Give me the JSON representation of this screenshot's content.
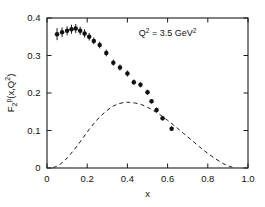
{
  "chart_data": {
    "type": "scatter",
    "title": "",
    "xlabel": "x",
    "ylabel": "F2p(x,Q2)",
    "ylabel_parts": {
      "base": "F",
      "sub": "2",
      "sup": "p",
      "args": "(x,Q",
      "args_sup": "2",
      "close": ")"
    },
    "xlim": [
      0.0,
      1.0
    ],
    "ylim": [
      0.0,
      0.4
    ],
    "xticks": [
      0.0,
      0.2,
      0.4,
      0.6,
      0.8,
      1.0
    ],
    "xticklabels": [
      "0",
      "0.2",
      "0.4",
      "0.6",
      "0.8",
      "1.0"
    ],
    "yticks": [
      0.0,
      0.1,
      0.2,
      0.3,
      0.4
    ],
    "yticklabels": [
      "0",
      "0.1",
      "0.2",
      "0.3",
      "0.4"
    ],
    "grid": false,
    "legend": "none",
    "annotations": [
      {
        "name": "q-squared-annotation",
        "text": "Q2 = 3.5 GeV2",
        "parts": {
          "sym": "Q",
          "sym_sup": "2",
          "mid": " = 3.5 GeV",
          "end_sup": "2"
        },
        "x": 0.6,
        "y": 0.352
      }
    ],
    "series": [
      {
        "name": "F2p measured data",
        "kind": "scatter-errorbar",
        "marker": "filled-circle",
        "color": "#111111",
        "x": [
          0.05,
          0.075,
          0.1,
          0.122,
          0.143,
          0.165,
          0.187,
          0.21,
          0.233,
          0.262,
          0.295,
          0.33,
          0.363,
          0.4,
          0.432,
          0.465,
          0.5,
          0.52,
          0.545,
          0.575,
          0.62
        ],
        "y": [
          0.357,
          0.362,
          0.366,
          0.37,
          0.372,
          0.366,
          0.359,
          0.35,
          0.339,
          0.328,
          0.307,
          0.281,
          0.268,
          0.252,
          0.229,
          0.222,
          0.202,
          0.178,
          0.155,
          0.133,
          0.105
        ],
        "yerr": [
          0.016,
          0.013,
          0.012,
          0.012,
          0.012,
          0.011,
          0.011,
          0.01,
          0.009,
          0.009,
          0.009,
          0.008,
          0.008,
          0.008,
          0.007,
          0.007,
          0.007,
          0.006,
          0.006,
          0.006,
          0.006
        ]
      },
      {
        "name": "model curve",
        "kind": "dashed-line",
        "color": "#1a1a1a",
        "x": [
          0.03,
          0.06,
          0.09,
          0.12,
          0.15,
          0.18,
          0.21,
          0.24,
          0.27,
          0.3,
          0.33,
          0.36,
          0.39,
          0.41,
          0.44,
          0.47,
          0.5,
          0.53,
          0.56,
          0.6,
          0.64,
          0.68,
          0.72,
          0.76,
          0.8,
          0.84,
          0.88,
          0.91,
          0.935
        ],
        "y": [
          0.001,
          0.008,
          0.021,
          0.039,
          0.059,
          0.081,
          0.103,
          0.123,
          0.14,
          0.154,
          0.165,
          0.172,
          0.175,
          0.175,
          0.173,
          0.169,
          0.162,
          0.153,
          0.143,
          0.127,
          0.11,
          0.092,
          0.074,
          0.056,
          0.039,
          0.024,
          0.011,
          0.004,
          0.0
        ]
      }
    ]
  }
}
